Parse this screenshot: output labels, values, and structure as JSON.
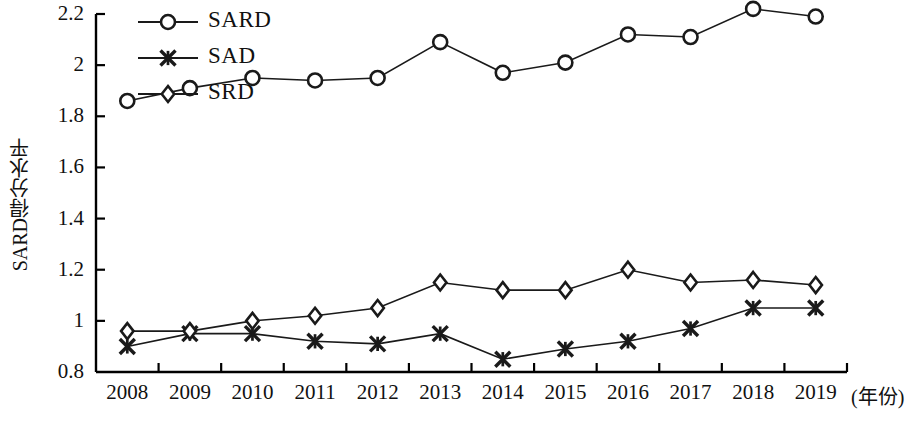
{
  "chart_data": {
    "type": "line",
    "title": "",
    "subtitle": "",
    "xlabel": "(年份)",
    "ylabel": "SARD得分水平",
    "categories": [
      "2008",
      "2009",
      "2010",
      "2011",
      "2012",
      "2013",
      "2014",
      "2015",
      "2016",
      "2017",
      "2018",
      "2019"
    ],
    "x": [
      2008,
      2009,
      2010,
      2011,
      2012,
      2013,
      2014,
      2015,
      2016,
      2017,
      2018,
      2019
    ],
    "ylim": [
      0.8,
      2.2
    ],
    "xlim": [
      2007.5,
      2019.5
    ],
    "yticks": [
      0.8,
      1,
      1.2,
      1.4,
      1.6,
      1.8,
      2,
      2.2
    ],
    "ytick_labels": [
      "0.8",
      "1",
      "1.2",
      "1.4",
      "1.6",
      "1.8",
      "2",
      "2.2"
    ],
    "grid": false,
    "legend_position": "top-left-inside",
    "series": [
      {
        "name": "SARD",
        "marker": "circle",
        "color": "#1a1a1a",
        "values": [
          1.86,
          1.91,
          1.95,
          1.94,
          1.95,
          2.09,
          1.97,
          2.01,
          2.12,
          2.11,
          2.22,
          2.19
        ]
      },
      {
        "name": "SAD",
        "marker": "star-x",
        "color": "#1a1a1a",
        "values": [
          0.9,
          0.95,
          0.95,
          0.92,
          0.91,
          0.95,
          0.85,
          0.89,
          0.92,
          0.97,
          1.05,
          1.05
        ]
      },
      {
        "name": "SRD",
        "marker": "diamond",
        "color": "#1a1a1a",
        "values": [
          0.96,
          0.96,
          1.0,
          1.02,
          1.05,
          1.15,
          1.12,
          1.12,
          1.2,
          1.15,
          1.16,
          1.14
        ]
      }
    ]
  },
  "axes": {
    "y_axis_title": "SARD得分水平",
    "x_axis_unit": "(年份)"
  },
  "legend": {
    "items": [
      {
        "label": "SARD",
        "marker": "circle"
      },
      {
        "label": "SAD",
        "marker": "star-x"
      },
      {
        "label": "SRD",
        "marker": "diamond"
      }
    ]
  },
  "style": {
    "line_color": "#1a1a1a",
    "axis_color": "#000000",
    "background": "#ffffff"
  }
}
